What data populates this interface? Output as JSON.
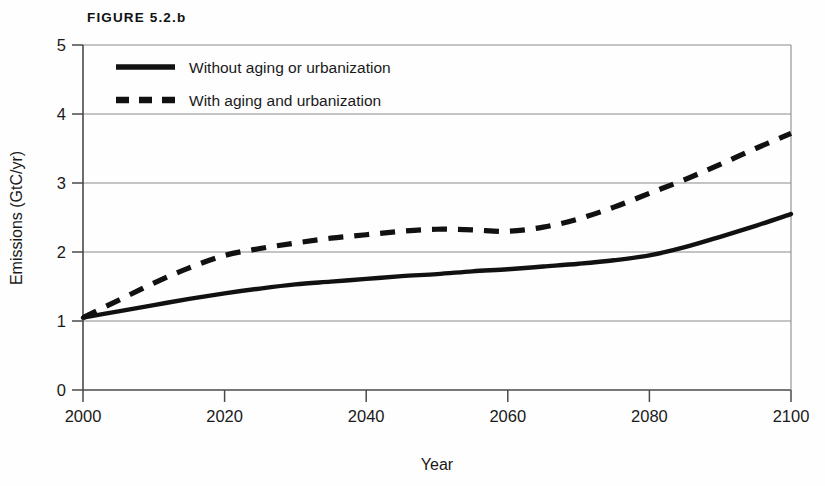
{
  "figure": {
    "label": "FIGURE 5.2.b"
  },
  "chart_data": {
    "type": "line",
    "title": "FIGURE 5.2.b",
    "xlabel": "Year",
    "ylabel": "Emissions (GtC/yr)",
    "xlim": [
      2000,
      2100
    ],
    "ylim": [
      0,
      5
    ],
    "xticks": [
      2000,
      2020,
      2040,
      2060,
      2080,
      2100
    ],
    "yticks": [
      0,
      1,
      2,
      3,
      4,
      5
    ],
    "xtick_labels": [
      "2000",
      "2020",
      "2040",
      "2060",
      "2080",
      "2100"
    ],
    "ytick_labels": [
      "0",
      "1",
      "2",
      "3",
      "4",
      "5"
    ],
    "grid": "horizontal",
    "legend_position": "upper-left-inside",
    "series": [
      {
        "name": "Without aging or urbanization",
        "style": "solid",
        "color": "#111111",
        "x": [
          2000,
          2005,
          2010,
          2015,
          2020,
          2025,
          2030,
          2035,
          2040,
          2045,
          2050,
          2055,
          2060,
          2065,
          2070,
          2075,
          2080,
          2085,
          2090,
          2095,
          2100
        ],
        "values": [
          1.05,
          1.14,
          1.23,
          1.32,
          1.4,
          1.47,
          1.53,
          1.57,
          1.61,
          1.65,
          1.68,
          1.72,
          1.75,
          1.79,
          1.83,
          1.88,
          1.95,
          2.07,
          2.22,
          2.38,
          2.55
        ]
      },
      {
        "name": "With aging and urbanization",
        "style": "dashed",
        "color": "#111111",
        "x": [
          2000,
          2005,
          2010,
          2015,
          2020,
          2025,
          2030,
          2035,
          2040,
          2045,
          2050,
          2055,
          2060,
          2065,
          2070,
          2075,
          2080,
          2085,
          2090,
          2095,
          2100
        ],
        "values": [
          1.05,
          1.3,
          1.55,
          1.77,
          1.95,
          2.05,
          2.13,
          2.2,
          2.25,
          2.3,
          2.33,
          2.32,
          2.3,
          2.36,
          2.48,
          2.65,
          2.85,
          3.05,
          3.27,
          3.5,
          3.72
        ]
      }
    ]
  },
  "legend": {
    "entries": [
      {
        "label": "Without aging or urbanization",
        "style": "solid"
      },
      {
        "label": "With aging and urbanization",
        "style": "dashed"
      }
    ]
  },
  "colors": {
    "ink": "#111111",
    "gridline": "#8a8a8a",
    "axis": "#555555",
    "background": "#fefefe"
  }
}
